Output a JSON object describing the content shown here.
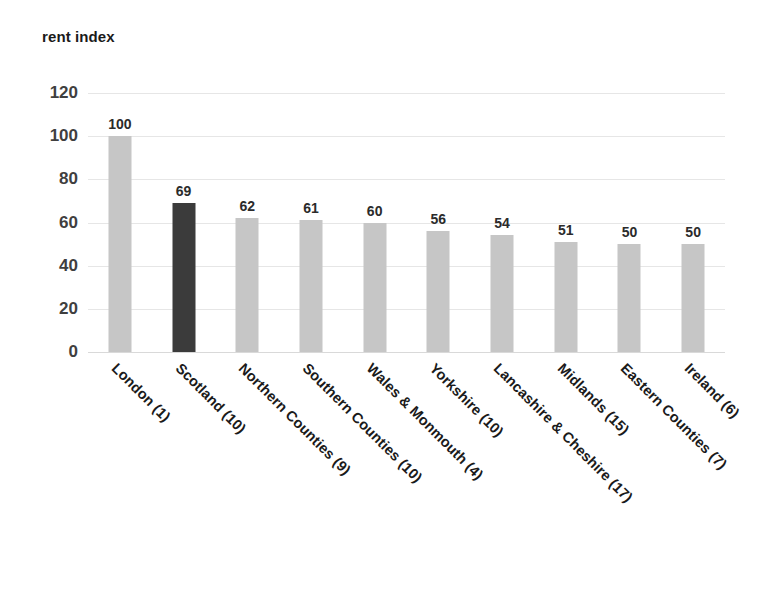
{
  "chart_data": {
    "type": "bar",
    "title": "rent index",
    "xlabel": "",
    "ylabel": "",
    "ylim": [
      0,
      120
    ],
    "ytick_values": [
      120,
      100,
      80,
      60,
      40,
      20,
      0
    ],
    "ytick_labels": [
      "120",
      "100",
      "80",
      "60",
      "40",
      "20",
      "0"
    ],
    "grid": true,
    "grid_axis": "y",
    "legend": "none",
    "categories": [
      "London (1)",
      "Scotland (10)",
      "Northern Counties (9)",
      "Southern Counties (10)",
      "Wales & Monmouth (4)",
      "Yorkshire (10)",
      "Lancashire & Cheshire (17)",
      "Midlands (15)",
      "Eastern Counties (7)",
      "Ireland (6)"
    ],
    "values": [
      100,
      69,
      62,
      61,
      60,
      56,
      54,
      51,
      50,
      50
    ],
    "value_labels": [
      "100",
      "69",
      "62",
      "61",
      "60",
      "56",
      "54",
      "51",
      "50",
      "50"
    ],
    "highlight_index": 1,
    "colors": {
      "bar": "#c6c6c6",
      "bar_highlight": "#3b3b3b",
      "gridline": "#e6e6e6",
      "baseline": "#d9d9d9",
      "text": "#1a1a1a",
      "tick_text": "#3f3f3f",
      "background": "#ffffff"
    }
  }
}
